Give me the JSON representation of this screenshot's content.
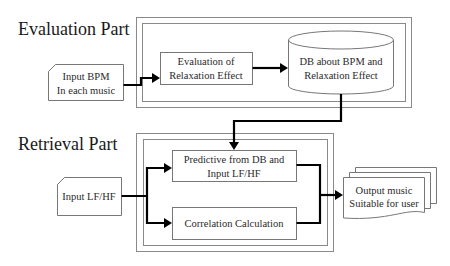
{
  "sections": {
    "evaluation": {
      "title": "Evaluation Part"
    },
    "retrieval": {
      "title": "Retrieval Part"
    }
  },
  "nodes": {
    "input_bpm": {
      "line1": "Input BPM",
      "line2": "In each music",
      "shape": "card"
    },
    "evaluation_box": {
      "line1": "Evaluation of",
      "line2": "Relaxation Effect",
      "shape": "process"
    },
    "db": {
      "line1": "DB about BPM and",
      "line2": "Relaxation Effect",
      "shape": "database-cylinder"
    },
    "input_lfhf": {
      "line1": "Input LF/HF",
      "shape": "card"
    },
    "predictive_box": {
      "line1": "Predictive from DB and",
      "line2": "Input LF/HF",
      "shape": "process"
    },
    "correlation_box": {
      "line1": "Correlation Calculation",
      "shape": "process"
    },
    "output": {
      "line1": "Output music",
      "line2": "Suitable for user",
      "shape": "multi-document"
    }
  },
  "edges": [
    {
      "from": "input_bpm",
      "to": "evaluation_box"
    },
    {
      "from": "evaluation_box",
      "to": "db"
    },
    {
      "from": "db",
      "to": "predictive_box"
    },
    {
      "from": "input_lfhf",
      "to": "predictive_box"
    },
    {
      "from": "input_lfhf",
      "to": "correlation_box"
    },
    {
      "from": "predictive_box",
      "to": "output"
    },
    {
      "from": "correlation_box",
      "to": "output"
    }
  ],
  "colors": {
    "background": "#ffffff",
    "edge": "#000000",
    "border": "#777777"
  }
}
